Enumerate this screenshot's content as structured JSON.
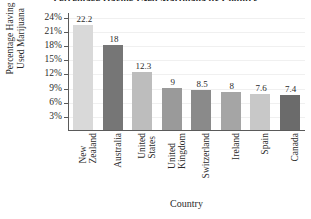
{
  "chart_data": {
    "type": "bar",
    "title": "Percentage Having Used Marijuana by Country",
    "xlabel": "Country",
    "ylabel_line1": "Percentage Having",
    "ylabel_line2": "Used Marijuana",
    "categories": [
      "New Zealand",
      "Australia",
      "United States",
      "United Kingdom",
      "Switzerland",
      "Ireland",
      "Spain",
      "Canada"
    ],
    "category_lines": [
      [
        "New",
        "Zealand"
      ],
      [
        "Australia"
      ],
      [
        "United",
        "States"
      ],
      [
        "United",
        "Kingdom"
      ],
      [
        "Switzerland"
      ],
      [
        "Ireland"
      ],
      [
        "Spain"
      ],
      [
        "Canada"
      ]
    ],
    "values": [
      22.2,
      18,
      12.3,
      9,
      8.5,
      8,
      7.6,
      7.4
    ],
    "value_labels": [
      "22.2",
      "18",
      "12.3",
      "9",
      "8.5",
      "8",
      "7.6",
      "7.4"
    ],
    "bar_colors": [
      "#d9d9d9",
      "#767676",
      "#bdbdbd",
      "#9a9a9a",
      "#8a8a8a",
      "#a5a5a5",
      "#c8c8c8",
      "#6b6b6b"
    ],
    "ylim": [
      0,
      25
    ],
    "yticks": [
      3,
      6,
      9,
      12,
      15,
      18,
      21,
      24
    ],
    "ytick_labels": [
      "3%",
      "6%",
      "9%",
      "12%",
      "15%",
      "18%",
      "21%",
      "24%"
    ],
    "grid": true,
    "legend": "none"
  }
}
